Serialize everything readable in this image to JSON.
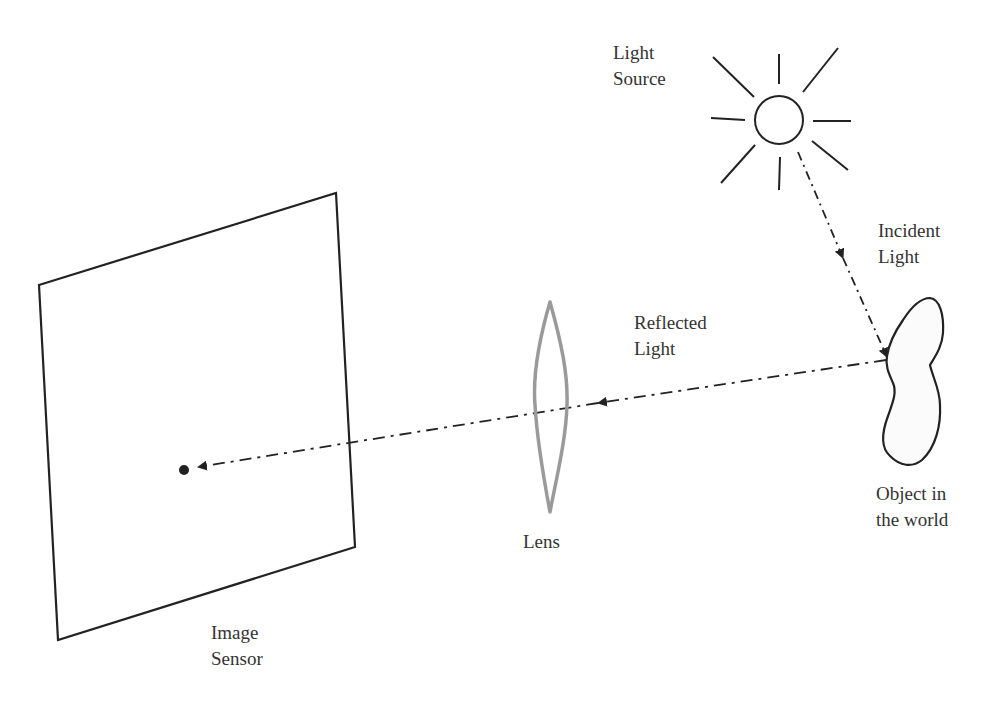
{
  "diagram": {
    "type": "optics / image formation",
    "colors": {
      "stroke": "#222222",
      "lens": "#9a9a9a",
      "text": "#333333",
      "background": "#ffffff"
    },
    "labels": {
      "light_source": {
        "line1": "Light",
        "line2": "Source"
      },
      "incident_light": {
        "line1": "Incident",
        "line2": "Light"
      },
      "reflected_light": {
        "line1": "Reflected",
        "line2": "Light"
      },
      "object": {
        "line1": "Object in",
        "line2": "the world"
      },
      "lens": {
        "line1": "Lens"
      },
      "image_sensor": {
        "line1": "Image",
        "line2": "Sensor"
      }
    },
    "elements": [
      {
        "id": "sun",
        "icon": "sun-icon",
        "label": "Light Source"
      },
      {
        "id": "incident-ray",
        "style": "dash-dot arrow",
        "label": "Incident Light"
      },
      {
        "id": "object",
        "shape": "irregular blob",
        "label": "Object in the world"
      },
      {
        "id": "reflected-ray",
        "style": "dash-dot arrow",
        "label": "Reflected Light"
      },
      {
        "id": "lens",
        "shape": "biconvex lens",
        "label": "Lens"
      },
      {
        "id": "image-sensor",
        "shape": "parallelogram plane",
        "label": "Image Sensor"
      },
      {
        "id": "image-point",
        "shape": "dot",
        "label": ""
      }
    ]
  }
}
